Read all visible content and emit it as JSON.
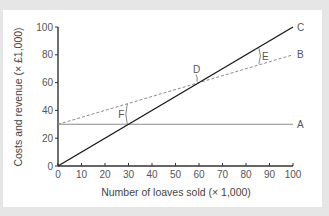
{
  "chart_data": {
    "type": "line",
    "title": "",
    "xlabel": "Number of loaves sold (× 1,000)",
    "ylabel": "Costs and revenue (× £1,000)",
    "xlim": [
      0,
      100
    ],
    "ylim": [
      0,
      100
    ],
    "x_ticks": [
      0,
      10,
      20,
      30,
      40,
      50,
      60,
      70,
      80,
      90,
      100
    ],
    "y_ticks": [
      0,
      20,
      40,
      60,
      80,
      100
    ],
    "grid": false,
    "legend": "none (lines labelled directly at right end)",
    "series": [
      {
        "name": "A",
        "style": "solid grey",
        "description": "Fixed costs",
        "x": [
          0,
          100
        ],
        "y": [
          30,
          30
        ]
      },
      {
        "name": "B",
        "style": "dashed grey",
        "description": "Total costs",
        "x": [
          0,
          100
        ],
        "y": [
          30,
          80
        ]
      },
      {
        "name": "C",
        "style": "solid black",
        "description": "Revenue",
        "x": [
          0,
          100
        ],
        "y": [
          0,
          100
        ]
      }
    ],
    "annotations": [
      {
        "label": "D",
        "x": 60,
        "y": 60,
        "note": "break-even point where C crosses B"
      },
      {
        "label": "E",
        "x": 85,
        "y": 77,
        "note": "gap between C and B (profit)"
      },
      {
        "label": "F",
        "x": 29,
        "y": 37,
        "note": "gap between B and A (variable cost)"
      }
    ]
  },
  "labels": {
    "xlabel": "Number of loaves sold (× 1,000)",
    "ylabel": "Costs and revenue (× £1,000)",
    "A": "A",
    "B": "B",
    "C": "C",
    "D": "D",
    "E": "E",
    "F": "F"
  }
}
